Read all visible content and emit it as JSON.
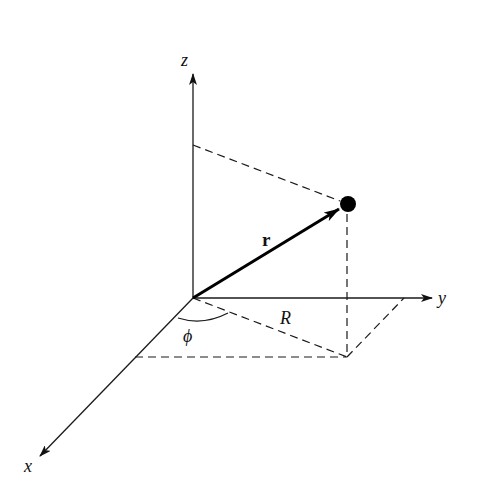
{
  "diagram": {
    "type": "3D coordinate system with position vector (cylindrical coordinates)",
    "axes": {
      "z": {
        "label": "z"
      },
      "y": {
        "label": "y"
      },
      "x": {
        "label": "x"
      }
    },
    "vector": {
      "label": "r"
    },
    "projection": {
      "label": "R"
    },
    "angle": {
      "label": "ϕ"
    },
    "point": {
      "label": "particle"
    },
    "colors": {
      "stroke": "#1a1a1a",
      "background": "#ffffff"
    }
  }
}
